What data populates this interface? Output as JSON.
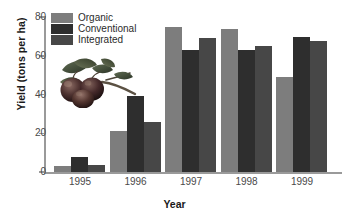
{
  "chart_data": {
    "type": "bar",
    "title": "",
    "xlabel": "Year",
    "ylabel": "Yield (tons per ha)",
    "categories": [
      "1995",
      "1996",
      "1997",
      "1998",
      "1999"
    ],
    "ylim": [
      0,
      80
    ],
    "yticks": [
      0,
      20,
      40,
      60,
      80
    ],
    "grid": false,
    "legend_position": "top-left",
    "series": [
      {
        "name": "Organic",
        "color": "#7d7d7d",
        "values": [
          3,
          21,
          75,
          74,
          49
        ]
      },
      {
        "name": "Conventional",
        "color": "#2e2e2e",
        "values": [
          8,
          39,
          63,
          63,
          69.5
        ]
      },
      {
        "name": "Integrated",
        "color": "#474747",
        "values": [
          3.5,
          26,
          69,
          65,
          67.5
        ]
      }
    ]
  },
  "legend": {
    "items": [
      {
        "label": "Organic"
      },
      {
        "label": "Conventional"
      },
      {
        "label": "Integrated"
      }
    ]
  },
  "axes": {
    "y_labels": [
      "80",
      "60",
      "40",
      "20",
      "0"
    ],
    "y_title": "Yield (tons per ha)",
    "x_title": "Year",
    "x_labels": [
      "1995",
      "1996",
      "1997",
      "1998",
      "1999"
    ]
  },
  "decorations": {
    "photo": "apples-on-branch-photo"
  }
}
